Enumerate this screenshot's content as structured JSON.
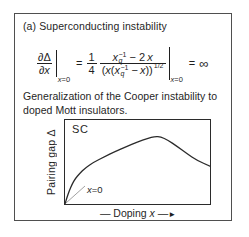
{
  "figure": {
    "title": "(a) Superconducting instability",
    "caption": "Generalization of the Cooper instability to doped Mott insulators."
  },
  "equation": {
    "partial": "∂",
    "delta": "Δ",
    "var_x": "x",
    "eval_x": "x",
    "eval_rest": "=0",
    "equals": "=",
    "coef_num": "1",
    "coef_den": "4",
    "sub_q": "q",
    "sup_minus_one": "−1",
    "minus_two": "− 2",
    "minus": "−",
    "open_paren": "(",
    "close_parens": "))",
    "exponent": "1/2",
    "infinity": "∞"
  },
  "plot": {
    "region_label": "SC",
    "ylabel": "Pairing gap Δ",
    "xlabel_pre": "— Doping ",
    "xlabel_var": "x",
    "xlabel_dash": " —",
    "xlabel_arrow": "►",
    "origin_var": "x",
    "origin_rest": "=0"
  },
  "chart_data": {
    "type": "line",
    "title": "",
    "xlabel": "Doping x",
    "ylabel": "Pairing gap Δ",
    "region_label": "SC",
    "annotations": [
      "x=0 marked at origin with leader line"
    ],
    "axes": "schematic sketch, no ticks or numeric scale; values normalized 0-1",
    "points": [
      [
        0.0,
        0.0
      ],
      [
        0.01,
        0.06
      ],
      [
        0.03,
        0.16
      ],
      [
        0.05,
        0.24
      ],
      [
        0.07,
        0.3
      ],
      [
        0.1,
        0.36
      ],
      [
        0.14,
        0.43
      ],
      [
        0.2,
        0.5
      ],
      [
        0.27,
        0.56
      ],
      [
        0.34,
        0.62
      ],
      [
        0.42,
        0.68
      ],
      [
        0.5,
        0.74
      ],
      [
        0.57,
        0.78
      ],
      [
        0.62,
        0.805
      ],
      [
        0.66,
        0.8
      ],
      [
        0.71,
        0.76
      ],
      [
        0.77,
        0.69
      ],
      [
        0.84,
        0.6
      ],
      [
        0.91,
        0.52
      ],
      [
        1.0,
        0.45
      ]
    ]
  }
}
